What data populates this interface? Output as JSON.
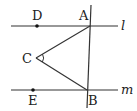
{
  "diagram": {
    "type": "geometry",
    "lines": [
      {
        "name": "l",
        "label": "l"
      },
      {
        "name": "m",
        "label": "m"
      },
      {
        "name": "transversal-AB",
        "label": ""
      }
    ],
    "points": {
      "A": {
        "label": "A"
      },
      "B": {
        "label": "B"
      },
      "C": {
        "label": "C"
      },
      "D": {
        "label": "D"
      },
      "E": {
        "label": "E"
      }
    },
    "segments": [
      "CA",
      "CB"
    ],
    "angle_marks": [
      "ACB"
    ]
  }
}
